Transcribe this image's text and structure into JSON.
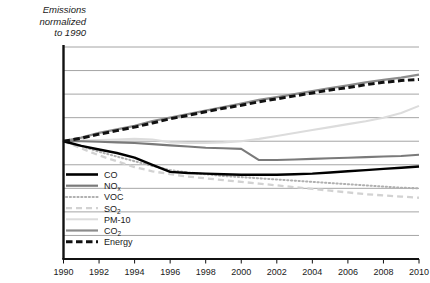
{
  "axis_title": "Emissions\nnormalized\nto 1990",
  "colors": {
    "CO": "#000000",
    "NOx": "#7a7a7a",
    "VOC": "#b0b0b0",
    "SO2": "#d2d2d2",
    "PM-10": "#dcdcdc",
    "CO2": "#8c8c8c",
    "Energy": "#111111",
    "gridline": "#8e8e8e",
    "axis": "#111111"
  },
  "legend": {
    "entries": [
      {
        "label": "CO",
        "sub": "",
        "key": "CO",
        "style": "solid",
        "width": 2.6,
        "color": "#000000"
      },
      {
        "label": "NO",
        "sub": "x",
        "key": "NOx",
        "style": "solid",
        "width": 2.2,
        "color": "#7a7a7a"
      },
      {
        "label": "VOC",
        "sub": "",
        "key": "VOC",
        "style": "dotted",
        "width": 2.0,
        "color": "#b0b0b0"
      },
      {
        "label": "SO",
        "sub": "2",
        "key": "SO2",
        "style": "dashed",
        "width": 2.2,
        "color": "#d2d2d2"
      },
      {
        "label": "PM-10",
        "sub": "",
        "key": "PM-10",
        "style": "solid",
        "width": 2.0,
        "color": "#dcdcdc"
      },
      {
        "label": "CO",
        "sub": "2",
        "key": "CO2",
        "style": "solid",
        "width": 2.2,
        "color": "#8c8c8c"
      },
      {
        "label": "Energy",
        "sub": "",
        "key": "Energy",
        "style": "thickdash",
        "width": 3.0,
        "color": "#111111"
      }
    ]
  },
  "chart_data": {
    "type": "line",
    "title": "",
    "subtitle": "",
    "xlabel": "",
    "ylabel": "Emissions normalized to 1990",
    "xlim": [
      1990,
      2010
    ],
    "ylim": [
      0.0,
      1.8
    ],
    "grid": true,
    "gridline_values": [
      0.2,
      0.4,
      0.6,
      0.8,
      1.0,
      1.2,
      1.4,
      1.6,
      1.8
    ],
    "y_tick_labels": [],
    "legend_position": "inside-lower-left",
    "xticks": [
      1990,
      1992,
      1994,
      1996,
      1998,
      2000,
      2002,
      2004,
      2006,
      2008,
      2010
    ],
    "x": [
      1990,
      1991,
      1992,
      1993,
      1994,
      1995,
      1996,
      1997,
      1998,
      1999,
      2000,
      2001,
      2002,
      2003,
      2004,
      2005,
      2006,
      2007,
      2008,
      2009,
      2010
    ],
    "series": [
      {
        "name": "CO",
        "values": [
          1.0,
          0.96,
          0.93,
          0.9,
          0.86,
          0.8,
          0.74,
          0.73,
          0.725,
          0.72,
          0.715,
          0.715,
          0.715,
          0.72,
          0.725,
          0.735,
          0.745,
          0.755,
          0.765,
          0.775,
          0.785
        ]
      },
      {
        "name": "NOx",
        "values": [
          1.0,
          1.0,
          0.995,
          0.99,
          0.985,
          0.975,
          0.965,
          0.955,
          0.945,
          0.94,
          0.935,
          0.84,
          0.84,
          0.845,
          0.85,
          0.855,
          0.86,
          0.865,
          0.87,
          0.875,
          0.885
        ]
      },
      {
        "name": "VOC",
        "values": [
          1.0,
          0.96,
          0.91,
          0.87,
          0.83,
          0.79,
          0.755,
          0.735,
          0.72,
          0.705,
          0.695,
          0.685,
          0.675,
          0.665,
          0.655,
          0.645,
          0.635,
          0.625,
          0.615,
          0.605,
          0.6
        ]
      },
      {
        "name": "SO2",
        "values": [
          1.0,
          0.94,
          0.88,
          0.83,
          0.78,
          0.745,
          0.72,
          0.7,
          0.685,
          0.67,
          0.655,
          0.64,
          0.625,
          0.61,
          0.595,
          0.58,
          0.565,
          0.55,
          0.54,
          0.53,
          0.52
        ]
      },
      {
        "name": "PM-10",
        "values": [
          1.0,
          1.005,
          1.01,
          1.015,
          1.02,
          1.015,
          0.99,
          0.985,
          0.985,
          0.99,
          1.0,
          1.02,
          1.045,
          1.07,
          1.095,
          1.12,
          1.145,
          1.17,
          1.2,
          1.24,
          1.3
        ]
      },
      {
        "name": "CO2",
        "values": [
          1.0,
          1.03,
          1.07,
          1.1,
          1.13,
          1.17,
          1.2,
          1.23,
          1.26,
          1.29,
          1.32,
          1.35,
          1.375,
          1.4,
          1.425,
          1.45,
          1.475,
          1.5,
          1.52,
          1.54,
          1.565
        ]
      },
      {
        "name": "Energy",
        "values": [
          1.0,
          1.025,
          1.06,
          1.09,
          1.12,
          1.155,
          1.19,
          1.22,
          1.25,
          1.28,
          1.305,
          1.335,
          1.36,
          1.385,
          1.41,
          1.435,
          1.455,
          1.48,
          1.5,
          1.515,
          1.525
        ]
      }
    ]
  }
}
